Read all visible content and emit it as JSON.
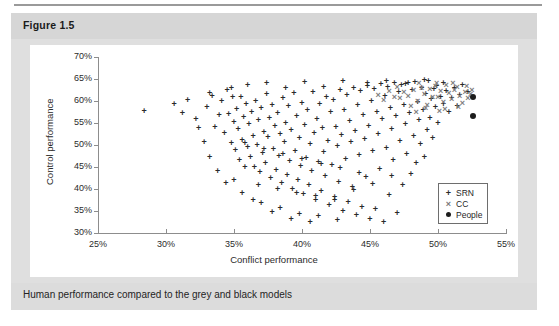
{
  "figure": {
    "header_label": "Figure 1.5",
    "caption": "Human performance compared to the grey and black models"
  },
  "chart_data": {
    "type": "scatter",
    "title": "",
    "xlabel": "Conflict performance",
    "ylabel": "Control performance",
    "xlim": [
      25,
      55
    ],
    "ylim": [
      30,
      70
    ],
    "xticks": [
      "25%",
      "30%",
      "35%",
      "40%",
      "45%",
      "50%",
      "55%"
    ],
    "yticks": [
      "30%",
      "35%",
      "40%",
      "45%",
      "50%",
      "55%",
      "60%",
      "65%",
      "70%"
    ],
    "xtick_values": [
      25,
      30,
      35,
      40,
      45,
      50,
      55
    ],
    "ytick_values": [
      30,
      35,
      40,
      45,
      50,
      55,
      60,
      65,
      70
    ],
    "grid": false,
    "legend_position": "lower-right",
    "legend": [
      {
        "name": "SRN",
        "marker": "plus",
        "color": "#2a2a2a"
      },
      {
        "name": "CC",
        "marker": "x",
        "color": "#7d7d7d"
      },
      {
        "name": "People",
        "marker": "circle",
        "color": "#1c1c1c"
      }
    ],
    "series": [
      {
        "name": "SRN",
        "marker": "plus",
        "color": "#2a2a2a",
        "points": [
          [
            28.4,
            57.8
          ],
          [
            31.6,
            60.3
          ],
          [
            32.2,
            55.9
          ],
          [
            33.0,
            58.6
          ],
          [
            33.4,
            61.2
          ],
          [
            33.6,
            54.2
          ],
          [
            33.9,
            56.8
          ],
          [
            34.1,
            59.9
          ],
          [
            34.3,
            52.7
          ],
          [
            34.5,
            62.4
          ],
          [
            34.6,
            57.1
          ],
          [
            34.8,
            50.4
          ],
          [
            34.9,
            60.8
          ],
          [
            35.0,
            55.3
          ],
          [
            35.1,
            48.9
          ],
          [
            35.2,
            58.2
          ],
          [
            35.3,
            53.6
          ],
          [
            35.4,
            46.7
          ],
          [
            35.5,
            61.0
          ],
          [
            35.6,
            51.2
          ],
          [
            35.7,
            56.4
          ],
          [
            35.8,
            44.9
          ],
          [
            35.9,
            59.3
          ],
          [
            36.0,
            49.6
          ],
          [
            36.1,
            54.8
          ],
          [
            36.2,
            47.3
          ],
          [
            36.3,
            57.6
          ],
          [
            36.4,
            52.1
          ],
          [
            36.5,
            45.1
          ],
          [
            36.6,
            60.1
          ],
          [
            36.7,
            50.0
          ],
          [
            36.8,
            55.7
          ],
          [
            36.9,
            43.8
          ],
          [
            37.0,
            58.4
          ],
          [
            37.1,
            48.2
          ],
          [
            37.2,
            53.0
          ],
          [
            37.3,
            46.0
          ],
          [
            37.4,
            61.5
          ],
          [
            37.5,
            51.8
          ],
          [
            37.6,
            56.2
          ],
          [
            37.7,
            42.6
          ],
          [
            37.8,
            59.0
          ],
          [
            37.9,
            49.1
          ],
          [
            38.0,
            54.3
          ],
          [
            38.1,
            44.4
          ],
          [
            38.2,
            57.2
          ],
          [
            38.3,
            47.6
          ],
          [
            38.4,
            52.5
          ],
          [
            38.5,
            41.3
          ],
          [
            38.6,
            60.6
          ],
          [
            38.7,
            50.7
          ],
          [
            38.8,
            55.0
          ],
          [
            38.9,
            43.2
          ],
          [
            39.0,
            58.8
          ],
          [
            39.1,
            46.4
          ],
          [
            39.2,
            53.4
          ],
          [
            39.3,
            40.1
          ],
          [
            39.4,
            61.8
          ],
          [
            39.5,
            48.7
          ],
          [
            39.6,
            56.6
          ],
          [
            39.7,
            42.0
          ],
          [
            39.8,
            51.5
          ],
          [
            39.9,
            45.2
          ],
          [
            40.0,
            59.6
          ],
          [
            40.1,
            38.9
          ],
          [
            40.2,
            54.6
          ],
          [
            40.3,
            47.0
          ],
          [
            40.4,
            57.9
          ],
          [
            40.5,
            40.8
          ],
          [
            40.6,
            50.2
          ],
          [
            40.7,
            44.1
          ],
          [
            40.8,
            62.0
          ],
          [
            40.9,
            52.8
          ],
          [
            41.0,
            37.6
          ],
          [
            41.1,
            56.0
          ],
          [
            41.2,
            46.2
          ],
          [
            41.3,
            59.4
          ],
          [
            41.4,
            39.5
          ],
          [
            41.5,
            53.8
          ],
          [
            41.6,
            48.4
          ],
          [
            41.7,
            43.0
          ],
          [
            41.8,
            61.0
          ],
          [
            41.9,
            51.0
          ],
          [
            42.0,
            36.4
          ],
          [
            42.1,
            57.4
          ],
          [
            42.2,
            45.5
          ],
          [
            42.3,
            60.2
          ],
          [
            42.4,
            38.2
          ],
          [
            42.5,
            54.0
          ],
          [
            42.6,
            49.8
          ],
          [
            42.7,
            41.6
          ],
          [
            42.8,
            62.6
          ],
          [
            42.9,
            52.2
          ],
          [
            43.0,
            35.1
          ],
          [
            43.1,
            58.0
          ],
          [
            43.2,
            46.8
          ],
          [
            43.3,
            61.4
          ],
          [
            43.4,
            37.0
          ],
          [
            43.5,
            55.4
          ],
          [
            43.6,
            50.6
          ],
          [
            43.7,
            40.4
          ],
          [
            43.8,
            63.0
          ],
          [
            43.9,
            53.2
          ],
          [
            44.0,
            34.0
          ],
          [
            44.1,
            59.2
          ],
          [
            44.2,
            47.8
          ],
          [
            44.3,
            62.2
          ],
          [
            44.4,
            36.0
          ],
          [
            44.5,
            56.8
          ],
          [
            44.6,
            51.4
          ],
          [
            44.7,
            42.8
          ],
          [
            44.8,
            63.4
          ],
          [
            44.9,
            54.4
          ],
          [
            45.0,
            33.2
          ],
          [
            45.1,
            60.0
          ],
          [
            45.2,
            48.6
          ],
          [
            45.3,
            62.8
          ],
          [
            45.4,
            35.4
          ],
          [
            45.5,
            57.6
          ],
          [
            45.6,
            52.6
          ],
          [
            45.7,
            44.6
          ],
          [
            45.8,
            63.8
          ],
          [
            45.9,
            55.8
          ],
          [
            46.0,
            32.6
          ],
          [
            46.1,
            61.2
          ],
          [
            46.2,
            49.4
          ],
          [
            46.3,
            63.2
          ],
          [
            46.4,
            38.6
          ],
          [
            46.5,
            58.4
          ],
          [
            46.6,
            53.6
          ],
          [
            46.7,
            46.6
          ],
          [
            46.8,
            64.0
          ],
          [
            46.9,
            56.6
          ],
          [
            47.0,
            34.6
          ],
          [
            47.1,
            62.0
          ],
          [
            47.2,
            50.8
          ],
          [
            47.3,
            63.6
          ],
          [
            47.4,
            41.0
          ],
          [
            47.5,
            59.0
          ],
          [
            47.6,
            54.8
          ],
          [
            47.7,
            48.0
          ],
          [
            47.8,
            64.2
          ],
          [
            47.9,
            57.2
          ],
          [
            48.0,
            43.4
          ],
          [
            48.1,
            62.4
          ],
          [
            48.2,
            52.0
          ],
          [
            48.3,
            64.4
          ],
          [
            48.4,
            45.8
          ],
          [
            48.5,
            59.8
          ],
          [
            48.6,
            55.6
          ],
          [
            48.7,
            50.2
          ],
          [
            48.8,
            63.0
          ],
          [
            48.9,
            58.0
          ],
          [
            49.0,
            47.2
          ],
          [
            49.1,
            61.6
          ],
          [
            49.2,
            53.4
          ],
          [
            49.3,
            64.6
          ],
          [
            49.4,
            56.2
          ],
          [
            49.5,
            60.4
          ],
          [
            49.6,
            51.6
          ],
          [
            49.7,
            62.8
          ],
          [
            49.8,
            58.6
          ],
          [
            49.9,
            63.4
          ],
          [
            50.0,
            55.0
          ],
          [
            50.2,
            61.0
          ],
          [
            50.4,
            59.4
          ],
          [
            50.6,
            62.2
          ],
          [
            50.8,
            57.4
          ],
          [
            51.0,
            60.6
          ],
          [
            51.2,
            63.0
          ],
          [
            51.4,
            58.8
          ],
          [
            51.6,
            61.4
          ],
          [
            36.0,
            63.6
          ],
          [
            37.4,
            64.2
          ],
          [
            38.8,
            63.0
          ],
          [
            40.2,
            64.4
          ],
          [
            41.6,
            63.2
          ],
          [
            43.0,
            64.6
          ],
          [
            34.8,
            63.0
          ],
          [
            33.2,
            61.8
          ],
          [
            37.0,
            36.8
          ],
          [
            38.4,
            35.6
          ],
          [
            39.8,
            34.4
          ],
          [
            41.2,
            33.8
          ],
          [
            42.6,
            33.0
          ],
          [
            40.6,
            32.4
          ],
          [
            39.2,
            33.2
          ],
          [
            37.8,
            34.8
          ],
          [
            36.4,
            37.4
          ],
          [
            35.6,
            39.0
          ],
          [
            34.4,
            41.4
          ],
          [
            33.8,
            44.0
          ],
          [
            33.2,
            47.2
          ],
          [
            32.8,
            50.6
          ],
          [
            32.4,
            53.8
          ],
          [
            44.8,
            64.0
          ],
          [
            46.2,
            64.6
          ],
          [
            47.6,
            63.8
          ],
          [
            49.0,
            64.8
          ],
          [
            50.4,
            64.2
          ],
          [
            51.8,
            63.6
          ],
          [
            52.2,
            62.0
          ],
          [
            30.6,
            59.4
          ],
          [
            31.2,
            57.2
          ],
          [
            35.0,
            42.0
          ],
          [
            36.8,
            41.0
          ],
          [
            38.2,
            40.0
          ],
          [
            39.6,
            39.2
          ],
          [
            41.0,
            38.4
          ],
          [
            42.4,
            37.6
          ],
          [
            43.8,
            39.8
          ],
          [
            45.2,
            41.2
          ],
          [
            46.6,
            43.0
          ],
          [
            44.2,
            43.6
          ],
          [
            42.8,
            44.8
          ],
          [
            41.4,
            45.6
          ],
          [
            40.0,
            46.8
          ],
          [
            38.6,
            48.0
          ],
          [
            37.2,
            49.2
          ],
          [
            35.8,
            50.4
          ]
        ]
      },
      {
        "name": "CC",
        "marker": "x",
        "color": "#7d7d7d",
        "points": [
          [
            47.8,
            61.2
          ],
          [
            48.2,
            62.4
          ],
          [
            48.5,
            60.0
          ],
          [
            48.8,
            63.0
          ],
          [
            49.0,
            61.6
          ],
          [
            49.2,
            59.2
          ],
          [
            49.4,
            62.8
          ],
          [
            49.6,
            60.8
          ],
          [
            49.8,
            63.4
          ],
          [
            50.0,
            61.0
          ],
          [
            50.2,
            62.2
          ],
          [
            50.4,
            59.8
          ],
          [
            50.6,
            63.6
          ],
          [
            50.8,
            61.8
          ],
          [
            51.0,
            60.4
          ],
          [
            51.2,
            62.6
          ],
          [
            51.4,
            63.2
          ],
          [
            51.6,
            61.2
          ],
          [
            51.8,
            59.6
          ],
          [
            52.0,
            62.0
          ],
          [
            52.2,
            60.6
          ],
          [
            52.4,
            61.6
          ],
          [
            47.5,
            62.0
          ],
          [
            47.2,
            60.6
          ],
          [
            48.0,
            58.8
          ],
          [
            48.6,
            64.0
          ],
          [
            49.1,
            58.4
          ],
          [
            49.9,
            64.2
          ],
          [
            50.5,
            58.2
          ],
          [
            51.1,
            64.0
          ],
          [
            51.5,
            58.6
          ],
          [
            52.1,
            63.4
          ],
          [
            52.5,
            62.4
          ],
          [
            50.1,
            57.8
          ],
          [
            48.4,
            57.6
          ],
          [
            46.8,
            61.0
          ],
          [
            46.4,
            62.2
          ],
          [
            46.0,
            60.2
          ],
          [
            47.0,
            63.2
          ],
          [
            45.6,
            61.4
          ]
        ]
      },
      {
        "name": "People",
        "marker": "circle",
        "color": "#1c1c1c",
        "points": [
          [
            52.6,
            60.9
          ],
          [
            52.6,
            56.7
          ]
        ]
      }
    ]
  }
}
